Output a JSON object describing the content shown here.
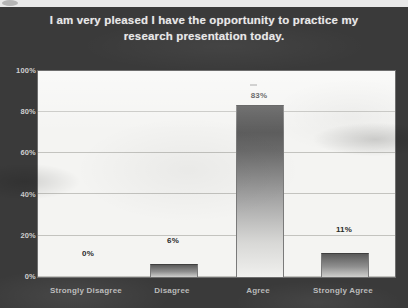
{
  "slide": {
    "title": "I am very pleased I have the opportunity to practice my research presentation today.",
    "background_color": "#3a3a3a",
    "title_color": "#e8e8e8"
  },
  "chart_data": {
    "type": "bar",
    "title": "I am very pleased I have the opportunity to practice my research presentation today.",
    "categories": [
      "Strongly Disagree",
      "Disagree",
      "Agree",
      "Strongly Agree"
    ],
    "values": [
      0,
      6,
      83,
      11
    ],
    "value_labels": [
      "0%",
      "6%",
      "83%",
      "11%"
    ],
    "xlabel": "",
    "ylabel": "",
    "ylim": [
      0,
      100
    ],
    "yticks": [
      0,
      20,
      40,
      60,
      80,
      100
    ],
    "ytick_labels": [
      "0%",
      "20%",
      "40%",
      "60%",
      "80%",
      "100%"
    ],
    "grid": true,
    "legend": "none",
    "series": [
      {
        "name": "Percent of respondents",
        "values": [
          0,
          6,
          83,
          11
        ]
      }
    ],
    "bar_color": "#5a5a5a",
    "plot_background": "#f4f4f2"
  }
}
